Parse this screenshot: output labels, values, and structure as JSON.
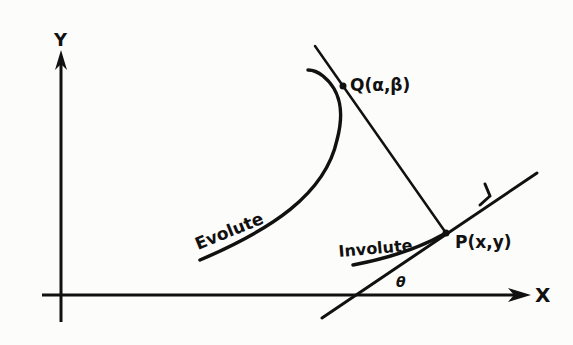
{
  "diagram": {
    "axes": {
      "x_label": "X",
      "y_label": "Y"
    },
    "curves": {
      "evolute_label": "Evolute",
      "involute_label": "Involute"
    },
    "points": {
      "q_label": "Q(α,β)",
      "p_label": "P(x,y)"
    },
    "angle_label": "θ",
    "colors": {
      "ink": "#111111",
      "paper": "#fcfcfa"
    }
  }
}
